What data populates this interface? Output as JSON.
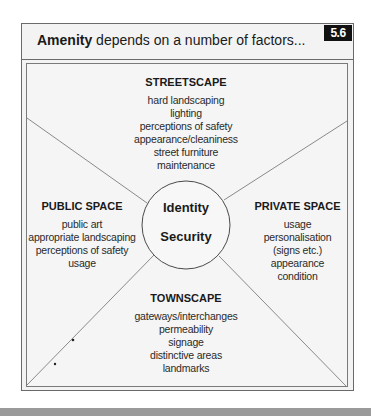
{
  "header": {
    "title_bold": "Amenity",
    "title_rest": " depends on a number of factors...",
    "badge": "5.6"
  },
  "center": {
    "lines": [
      "Identity",
      "Security"
    ]
  },
  "sections": {
    "streetscape": {
      "heading": "STREETSCAPE",
      "items": [
        "hard landscaping",
        "lighting",
        "perceptions of safety",
        "appearance/cleaniness",
        "street furniture",
        "maintenance"
      ]
    },
    "public_space": {
      "heading": "PUBLIC SPACE",
      "items": [
        "public art",
        "appropriate landscaping",
        "perceptions of safety",
        "usage"
      ]
    },
    "private_space": {
      "heading": "PRIVATE SPACE",
      "items": [
        "usage",
        "personalisation",
        "(signs etc.)",
        "appearance",
        "condition"
      ]
    },
    "townscape": {
      "heading": "TOWNSCAPE",
      "items": [
        "gateways/interchanges",
        "permeability",
        "signage",
        "distinctive areas",
        "landmarks"
      ]
    }
  },
  "colors": {
    "panel_bg": "#f3f3f3",
    "border": "#6a6a6a",
    "badge_bg": "#111111",
    "line": "#8a8a8a",
    "footer_band": "#9a9a9a"
  }
}
